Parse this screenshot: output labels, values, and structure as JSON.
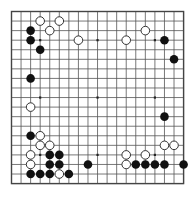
{
  "board": {
    "title": "Go game position",
    "size": 19,
    "grid_lines": 19,
    "line_color": "#555555",
    "border_color": "#444444",
    "background_color": "#ffffff",
    "black_stone_color": "#111111",
    "white_stone_color": "#ffffff",
    "white_stone_outline": "#333333",
    "star_point_color": "#222222",
    "geometry": {
      "origin_x": 11.5,
      "origin_y": 11.5,
      "spacing": 9.56,
      "stone_radius": 4.3,
      "star_radius": 1.1
    },
    "star_points": [
      [
        3,
        3
      ],
      [
        9,
        3
      ],
      [
        15,
        3
      ],
      [
        3,
        9
      ],
      [
        9,
        9
      ],
      [
        15,
        9
      ],
      [
        3,
        15
      ],
      [
        9,
        15
      ],
      [
        15,
        15
      ]
    ],
    "stones": {
      "black_count": 25,
      "white_count": 19,
      "black": [
        [
          2,
          2
        ],
        [
          2,
          3
        ],
        [
          3,
          4
        ],
        [
          16,
          3
        ],
        [
          17,
          5
        ],
        [
          2,
          7
        ],
        [
          16,
          11
        ],
        [
          2,
          13
        ],
        [
          4,
          15
        ],
        [
          5,
          15
        ],
        [
          4,
          16
        ],
        [
          5,
          16
        ],
        [
          2,
          17
        ],
        [
          3,
          17
        ],
        [
          4,
          17
        ],
        [
          6,
          17
        ],
        [
          8,
          16
        ],
        [
          13,
          16
        ],
        [
          14,
          16
        ],
        [
          15,
          16
        ],
        [
          16,
          16
        ],
        [
          18,
          16
        ]
      ],
      "white": [
        [
          3,
          1
        ],
        [
          5,
          1
        ],
        [
          4,
          2
        ],
        [
          7,
          3
        ],
        [
          12,
          3
        ],
        [
          14,
          2
        ],
        [
          2,
          10
        ],
        [
          3,
          13
        ],
        [
          4,
          14
        ],
        [
          3,
          14
        ],
        [
          2,
          15
        ],
        [
          2,
          16
        ],
        [
          5,
          17
        ],
        [
          12,
          15
        ],
        [
          14,
          15
        ],
        [
          17,
          14
        ],
        [
          16,
          14
        ],
        [
          12,
          16
        ]
      ]
    }
  }
}
